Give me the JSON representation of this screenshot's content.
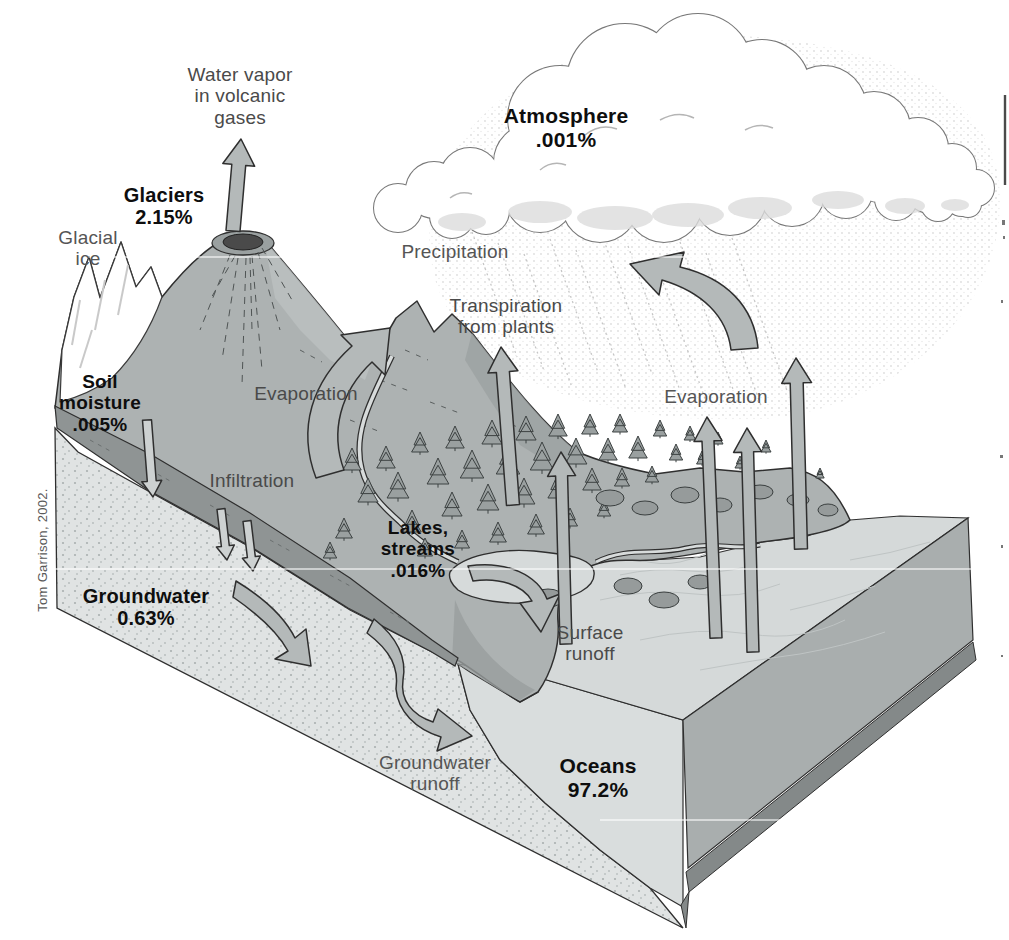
{
  "credit": "Tom Garrison, 2002.",
  "labels": {
    "water_vapor": "Water vapor\nin volcanic\ngases",
    "glaciers": "Glaciers\n2.15%",
    "glacial_ice": "Glacial\nice",
    "atmosphere": "Atmosphere\n.001%",
    "precipitation": "Precipitation",
    "transpiration": "Transpiration\nfrom plants",
    "evaporation_land": "Evaporation",
    "evaporation_ocean": "Evaporation",
    "infiltration": "Infiltration",
    "soil_moisture": "Soil\nmoisture\n.005%",
    "lakes_streams": "Lakes,\nstreams\n.016%",
    "groundwater": "Groundwater\n0.63%",
    "surface_runoff": "Surface\nrunoff",
    "groundwater_runoff": "Groundwater\nrunoff",
    "oceans": "Oceans\n97.2%"
  },
  "water_distribution": [
    {
      "reservoir": "Oceans",
      "percent": "97.2%"
    },
    {
      "reservoir": "Glaciers",
      "percent": "2.15%"
    },
    {
      "reservoir": "Groundwater",
      "percent": "0.63%"
    },
    {
      "reservoir": "Lakes, streams",
      "percent": ".016%"
    },
    {
      "reservoir": "Soil moisture",
      "percent": ".005%"
    },
    {
      "reservoir": "Atmosphere",
      "percent": ".001%"
    }
  ],
  "colors": {
    "background": "#ffffff",
    "terrain": "#adb2b2",
    "terrain_shadow": "#9ba0a0",
    "terrain_light": "#bcc1c1",
    "soil_band": "#8f9494",
    "groundwater_face": "#e0e3e3",
    "ocean_front": "#d9dddd",
    "ocean_top": "#d5d9d9",
    "block_right": "#a9aeae",
    "block_base": "#848989",
    "arrow_fill": "#b4b9b9",
    "outline": "#2f2f2f",
    "cloud_outline": "#777777",
    "label_text": "#4a4a4a",
    "label_strong": "#0e0e0e"
  }
}
